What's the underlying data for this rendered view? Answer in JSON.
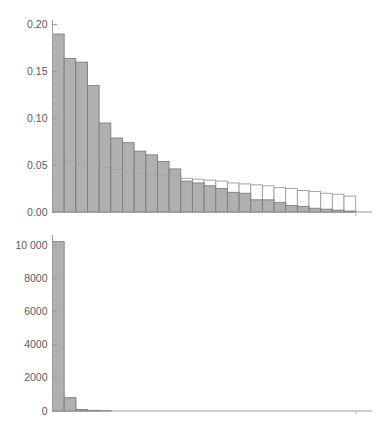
{
  "figure": {
    "background_color": "#ffffff",
    "bar_fill_color": "#a9a9a9",
    "bar_fill_edge_color": "#7e7e7e",
    "bar_open_fill_color": "#ffffff",
    "bar_open_edge_color": "#9b9b9b",
    "axis_color": "#9a9a9a",
    "tick_label_color": "#5b5b5b",
    "clipped_top_text": "",
    "panels": [
      {
        "name": "top-panel",
        "id": "probability-histogram"
      },
      {
        "name": "bottom-panel",
        "id": "count-histogram"
      }
    ]
  },
  "chart_data": [
    {
      "type": "bar",
      "title": "",
      "subtitle": "",
      "xlabel": "",
      "ylabel": "",
      "grid": false,
      "legend_position": "none",
      "ylim": [
        0,
        0.205
      ],
      "xlim": [
        0,
        27.4
      ],
      "ytick_labels": [
        "0.00",
        "0.05",
        "0.10",
        "0.15",
        "0.20"
      ],
      "ytick_values": [
        0.0,
        0.05,
        0.1,
        0.15,
        0.2
      ],
      "yminor_values": [
        0.01,
        0.02,
        0.03,
        0.04,
        0.06,
        0.07,
        0.08,
        0.09,
        0.11,
        0.12,
        0.13,
        0.14,
        0.16,
        0.17,
        0.18,
        0.19
      ],
      "xtick_labels": [],
      "bin_edges": [
        0,
        1,
        2,
        3,
        4,
        5,
        6,
        7,
        8,
        9,
        10,
        11,
        12,
        13,
        14,
        15,
        16,
        17,
        18,
        19,
        20,
        21,
        22,
        23,
        24,
        25,
        26
      ],
      "series": [
        {
          "name": "observed",
          "style": "filled",
          "values": [
            0.19,
            0.164,
            0.16,
            0.135,
            0.095,
            0.079,
            0.074,
            0.065,
            0.061,
            0.054,
            0.046,
            0.033,
            0.031,
            0.028,
            0.025,
            0.021,
            0.02,
            0.013,
            0.013,
            0.01,
            0.007,
            0.006,
            0.004,
            0.003,
            0.002,
            0.001
          ]
        },
        {
          "name": "expected",
          "style": "outlined",
          "values": [
            0.059,
            0.055,
            0.052,
            0.051,
            0.048,
            0.045,
            0.043,
            0.041,
            0.04,
            0.039,
            0.039,
            0.036,
            0.035,
            0.034,
            0.033,
            0.031,
            0.03,
            0.029,
            0.028,
            0.026,
            0.025,
            0.023,
            0.022,
            0.02,
            0.019,
            0.017
          ]
        }
      ]
    },
    {
      "type": "bar",
      "title": "",
      "subtitle": "",
      "xlabel": "",
      "ylabel": "",
      "grid": false,
      "legend_position": "none",
      "ylim": [
        0,
        10600
      ],
      "xlim": [
        0,
        27.4
      ],
      "ytick_labels": [
        "0",
        "2000",
        "4000",
        "6000",
        "8000",
        "10 000"
      ],
      "ytick_values": [
        0,
        2000,
        4000,
        6000,
        8000,
        10000
      ],
      "yminor_values": [
        500,
        1000,
        1500,
        2500,
        3000,
        3500,
        4500,
        5000,
        5500,
        6500,
        7000,
        7500,
        8500,
        9000,
        9500
      ],
      "xtick_labels": [],
      "bin_edges": [
        0,
        1,
        2,
        3,
        4,
        5,
        6,
        7,
        8,
        9,
        10,
        11,
        12,
        13,
        14,
        15,
        16,
        17,
        18,
        19,
        20,
        21,
        22,
        23,
        24,
        25,
        26
      ],
      "series": [
        {
          "name": "observed",
          "style": "filled",
          "values": [
            10200,
            800,
            90,
            40,
            25,
            18,
            14,
            11,
            9,
            8,
            7,
            6,
            5,
            5,
            4,
            4,
            3,
            3,
            2,
            2,
            2,
            1,
            1,
            1,
            1,
            1
          ]
        },
        {
          "name": "expected",
          "style": "outlined",
          "values": [
            1020,
            760,
            80,
            35,
            22,
            16,
            12,
            10,
            8,
            7,
            6,
            5,
            5,
            4,
            4,
            3,
            3,
            2,
            2,
            2,
            1,
            1,
            1,
            1,
            1,
            1
          ]
        }
      ]
    }
  ]
}
